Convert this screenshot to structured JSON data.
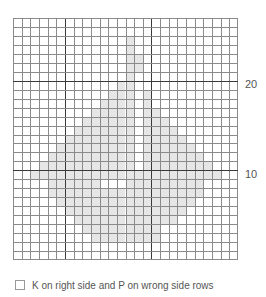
{
  "chart_data": {
    "type": "heatmap",
    "title": "",
    "columns": 26,
    "rows": 27,
    "row_numbering": "bottom-up",
    "row_labels": [
      {
        "label": "20",
        "row_from_bottom": 20
      },
      {
        "label": "10",
        "row_from_bottom": 10
      }
    ],
    "major_grid_every": 10,
    "shaded_color": "#e6e6e6",
    "grid_color": "#8a8a8a",
    "major_grid_color": "#3a3a3a",
    "shaded_rows_top_down": [
      [],
      [],
      [
        [
          13,
          13
        ]
      ],
      [
        [
          13,
          13
        ]
      ],
      [
        [
          13,
          14
        ]
      ],
      [
        [
          13,
          14
        ]
      ],
      [
        [
          13,
          13
        ]
      ],
      [
        [
          12,
          13
        ]
      ],
      [
        [
          11,
          13
        ],
        [
          15,
          15
        ]
      ],
      [
        [
          10,
          13
        ],
        [
          15,
          15
        ]
      ],
      [
        [
          9,
          13
        ],
        [
          15,
          16
        ]
      ],
      [
        [
          8,
          13
        ],
        [
          15,
          17
        ]
      ],
      [
        [
          7,
          13
        ],
        [
          15,
          18
        ]
      ],
      [
        [
          6,
          13
        ],
        [
          15,
          19
        ]
      ],
      [
        [
          5,
          13
        ],
        [
          15,
          20
        ]
      ],
      [
        [
          4,
          13
        ],
        [
          15,
          21
        ]
      ],
      [
        [
          3,
          13
        ],
        [
          15,
          22
        ]
      ],
      [
        [
          2,
          23
        ]
      ],
      [
        [
          4,
          9
        ],
        [
          13,
          21
        ]
      ],
      [
        [
          4,
          21
        ]
      ],
      [
        [
          5,
          20
        ]
      ],
      [
        [
          6,
          19
        ]
      ],
      [
        [
          7,
          18
        ]
      ],
      [
        [
          8,
          16
        ]
      ],
      [
        [
          9,
          16
        ]
      ],
      [],
      []
    ]
  },
  "legend": {
    "items": [
      {
        "symbol": "empty-square",
        "label": "K on right side and P on wrong side rows"
      }
    ]
  }
}
